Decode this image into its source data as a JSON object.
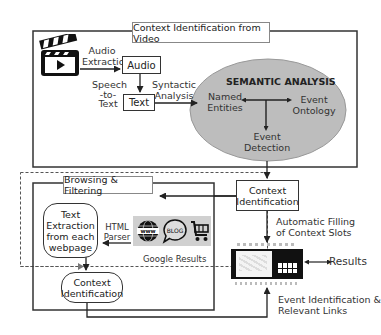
{
  "top_section": {
    "title": "Context Identification from Video",
    "video_icon": "clapperboard-video-icon",
    "audio_extraction_label": [
      "Audio",
      "Extraction"
    ],
    "audio_box": "Audio",
    "speech_to_text_label": [
      "Speech",
      "-to-",
      "Text"
    ],
    "text_box": "Text",
    "syntactic_analysis_label": [
      "Syntactic",
      "Analysis"
    ]
  },
  "semantic_analysis": {
    "title": "SEMANTIC ANALYSIS",
    "named_entities": [
      "Named",
      "Entities"
    ],
    "event_ontology": [
      "Event",
      "Ontology"
    ],
    "event_detection": [
      "Event",
      "Detection"
    ],
    "fill_color": "#bdbdbd"
  },
  "right_flow": {
    "context_identification": [
      "Context",
      "Identification"
    ],
    "automatic_filling_label": [
      "Automatic Filling",
      "of Context Slots"
    ],
    "results_label": "Results",
    "event_identification_label": [
      "Event Identification &",
      "Relevant Links"
    ]
  },
  "bottom_section": {
    "title": "Browsing & Filtering",
    "text_extraction_box": [
      "Text",
      "Extraction",
      "from each",
      "webpage"
    ],
    "html_parser_label": [
      "HTML",
      "Parser"
    ],
    "google_results_label": "Google Results",
    "google_icons": [
      "www-globe-icon",
      "blog-bubble-icon",
      "shopping-cart-icon"
    ],
    "context_identification_box": [
      "Context",
      "Identification"
    ]
  }
}
